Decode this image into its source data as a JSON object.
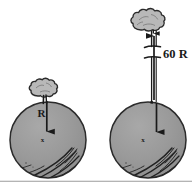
{
  "figure": {
    "caption": "",
    "background_color": "#ffffff",
    "ink_color": "#1a1a1a",
    "sphere_fill_color": "#9a9a9a",
    "sphere_stroke_color": "#2b2b2b",
    "tree_fill_color": "#b8b8b8",
    "tree_stroke_color": "#2b2b2b",
    "border_color": "#9b9b9b"
  },
  "panels": [
    {
      "id": "left-panel",
      "name": "surface-case",
      "sphere": {
        "name": "planet-sphere-left",
        "cx": 48,
        "cy": 140,
        "r": 38,
        "fill": "#9a9a9a"
      },
      "tree": {
        "name": "tree-left",
        "cx": 44,
        "cy": 94,
        "label": ""
      },
      "radius_arrow": {
        "name": "radius-arrow-left",
        "label": "R",
        "from_y": 102,
        "to_y": 138,
        "x": 47
      },
      "center_mark": {
        "name": "center-mark-left",
        "glyph": "x",
        "x": 47,
        "y": 140
      }
    },
    {
      "id": "right-panel",
      "name": "altitude-case",
      "sphere": {
        "name": "planet-sphere-right",
        "cx": 148,
        "cy": 140,
        "r": 38,
        "fill": "#9a9a9a"
      },
      "tree": {
        "name": "tree-right",
        "cx": 152,
        "cy": 16,
        "label": ""
      },
      "distance_annotation": {
        "name": "distance-label-60R",
        "label": "60 R",
        "x": 164,
        "y": 53
      },
      "altitude_arrow": {
        "name": "altitude-arrow-right",
        "x": 157,
        "from_y": 100,
        "to_y": 30
      },
      "radius_arrow": {
        "name": "radius-arrow-right",
        "x": 157,
        "from_y": 102,
        "to_y": 138
      },
      "center_mark": {
        "name": "center-mark-right",
        "glyph": "x",
        "x": 147,
        "y": 140
      },
      "break_mark": {
        "name": "line-break-mark",
        "y_upper": 46,
        "y_lower": 57
      }
    }
  ],
  "labels": {
    "radius_label": "R",
    "distance_label": "60 R",
    "center_glyph": "x"
  }
}
